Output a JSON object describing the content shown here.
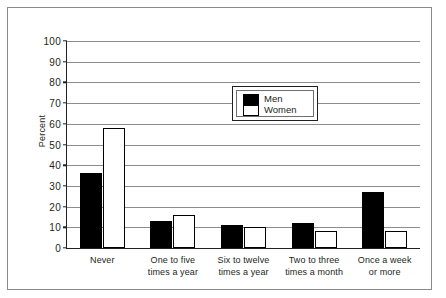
{
  "chart_data": {
    "type": "bar",
    "title": "",
    "subtitle": "",
    "xlabel": "",
    "ylabel": "Percent",
    "ylim": [
      0,
      100
    ],
    "ytick_values": [
      0,
      10,
      20,
      30,
      40,
      50,
      60,
      70,
      80,
      90,
      100
    ],
    "ytick_labels": [
      "0",
      "10",
      "20",
      "30",
      "40",
      "50",
      "60",
      "70",
      "80",
      "90",
      "100"
    ],
    "grid": true,
    "legend_position": "upper-center",
    "categories": [
      "Never",
      "One to five times a year",
      "Six to twelve times a year",
      "Two to three times a month",
      "Once a week or more"
    ],
    "category_lines": [
      [
        "Never"
      ],
      [
        "One to five",
        "times a year"
      ],
      [
        "Six to twelve",
        "times a year"
      ],
      [
        "Two to three",
        "times a month"
      ],
      [
        "Once a week",
        "or more"
      ]
    ],
    "series": [
      {
        "name": "Men",
        "color": "#000000",
        "values": [
          36,
          13,
          11,
          12,
          27
        ]
      },
      {
        "name": "Women",
        "color": "#ffffff",
        "values": [
          58,
          16,
          10,
          8,
          8
        ]
      }
    ]
  },
  "legend": {
    "men_label": "Men",
    "women_label": "Women"
  },
  "axis": {
    "y_title": "Percent"
  }
}
